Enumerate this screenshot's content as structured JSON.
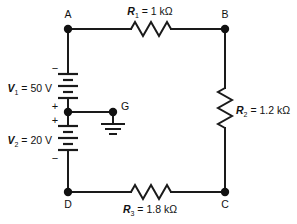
{
  "diagram": {
    "background_color": "#ffffff",
    "line_color": "#1a1a1a"
  },
  "nodes": [
    {
      "id": "A",
      "label": "A",
      "x": 68,
      "y": 29
    },
    {
      "id": "B",
      "label": "B",
      "x": 225,
      "y": 29
    },
    {
      "id": "C",
      "label": "C",
      "x": 225,
      "y": 192
    },
    {
      "id": "D",
      "label": "D",
      "x": 68,
      "y": 192
    },
    {
      "id": "G",
      "label": "G",
      "x": 113,
      "y": 112
    }
  ],
  "resistors": [
    {
      "id": "R1",
      "symbol": "R",
      "subscript": "1",
      "equals": "=",
      "value": "1 kΩ",
      "full_label": "R₁ = 1 kΩ",
      "orientation": "horizontal",
      "between": "A-B",
      "label_x": 150,
      "label_y": 15
    },
    {
      "id": "R2",
      "symbol": "R",
      "subscript": "2",
      "equals": "=",
      "value": "1.2 kΩ",
      "full_label": "R₂ = 1.2 kΩ",
      "orientation": "vertical",
      "between": "B-C",
      "label_x": 236,
      "label_y": 114
    },
    {
      "id": "R3",
      "symbol": "R",
      "subscript": "3",
      "equals": "=",
      "value": "1.8 kΩ",
      "full_label": "R₃ = 1.8 kΩ",
      "orientation": "horizontal",
      "between": "D-C",
      "label_x": 150,
      "label_y": 210
    }
  ],
  "sources": [
    {
      "id": "V1",
      "symbol": "V",
      "subscript": "1",
      "equals": "=",
      "value": "50 V",
      "full_label": "V₁ = 50 V",
      "top_sign": "−",
      "bottom_sign": "+",
      "between": "A-G",
      "label_x": 50,
      "label_y": 94
    },
    {
      "id": "V2",
      "symbol": "V",
      "subscript": "2",
      "equals": "=",
      "value": "20 V",
      "full_label": "V₂ = 20 V",
      "top_sign": "+",
      "bottom_sign": "−",
      "between": "G-D",
      "label_x": 50,
      "label_y": 136
    }
  ],
  "ground": {
    "label": "G",
    "icon": "ground-icon",
    "x": 113,
    "y": 112
  }
}
